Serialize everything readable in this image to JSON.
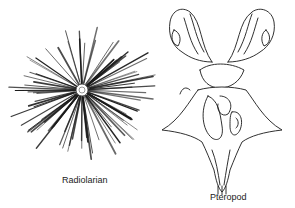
{
  "figure": {
    "panels": [
      {
        "id": "radiolarian",
        "label": "Radiolarian"
      },
      {
        "id": "pteropod",
        "label": "Pteropod"
      }
    ]
  },
  "colors": {
    "ink": "#1a1a1a",
    "background": "#ffffff"
  }
}
